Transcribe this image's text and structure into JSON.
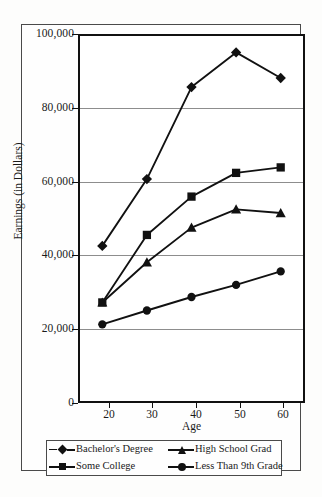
{
  "chart_data": {
    "type": "line",
    "title": "",
    "xlabel": "Age",
    "ylabel": "Earnings (in Dollars)",
    "x": [
      20,
      30,
      40,
      50,
      60
    ],
    "xtick_labels": [
      "20",
      "30",
      "40",
      "50",
      "60"
    ],
    "ytick_labels": [
      "0",
      "20,000",
      "40,000",
      "60,000",
      "80,000",
      "100,000"
    ],
    "ytick_values": [
      0,
      20000,
      40000,
      60000,
      80000,
      100000
    ],
    "xlim": [
      15,
      65
    ],
    "ylim": [
      0,
      100000
    ],
    "grid": "horizontal",
    "legend_position": "bottom",
    "series": [
      {
        "name": "Bachelor's Degree",
        "marker": "diamond",
        "line_style": "dashed-key",
        "values": [
          42500,
          60800,
          86000,
          95500,
          88500
        ]
      },
      {
        "name": "High School Grad",
        "marker": "triangle",
        "line_style": "solid",
        "values": [
          27000,
          38000,
          47500,
          52500,
          51500
        ]
      },
      {
        "name": "Some College",
        "marker": "square",
        "line_style": "solid",
        "values": [
          27000,
          45500,
          56000,
          62500,
          64000
        ]
      },
      {
        "name": "Less Than 9th Grade",
        "marker": "circle",
        "line_style": "solid",
        "values": [
          21000,
          24800,
          28500,
          31800,
          35500
        ]
      }
    ],
    "legend_order": [
      "Bachelor's Degree",
      "High School Grad",
      "Some College",
      "Less Than 9th Grade"
    ],
    "colors": {
      "series_color": "#111111",
      "gridline_color": "#8d8d8d",
      "axis_color": "#111111",
      "background": "#ffffff"
    }
  }
}
